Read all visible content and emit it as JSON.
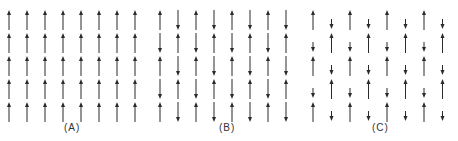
{
  "figure": {
    "color": "#2a2a2a",
    "panels": [
      {
        "id": "A",
        "label": "(A)",
        "name": "ferromagnetic",
        "columns": 8,
        "rows": 5,
        "spins": [
          [
            "up",
            "up",
            "up",
            "up",
            "up",
            "up",
            "up",
            "up"
          ],
          [
            "up",
            "up",
            "up",
            "up",
            "up",
            "up",
            "up",
            "up"
          ],
          [
            "up",
            "up",
            "up",
            "up",
            "up",
            "up",
            "up",
            "up"
          ],
          [
            "up",
            "up",
            "up",
            "up",
            "up",
            "up",
            "up",
            "up"
          ],
          [
            "up",
            "up",
            "up",
            "up",
            "up",
            "up",
            "up",
            "up"
          ]
        ],
        "magnitude_up": 1.0,
        "magnitude_down": 1.0
      },
      {
        "id": "B",
        "label": "(B)",
        "name": "antiferromagnetic",
        "columns": 8,
        "rows": 5,
        "spins": [
          [
            "up",
            "down",
            "up",
            "down",
            "up",
            "down",
            "up",
            "down"
          ],
          [
            "down",
            "up",
            "down",
            "up",
            "down",
            "up",
            "down",
            "up"
          ],
          [
            "up",
            "down",
            "up",
            "down",
            "up",
            "down",
            "up",
            "down"
          ],
          [
            "down",
            "up",
            "down",
            "up",
            "down",
            "up",
            "down",
            "up"
          ],
          [
            "up",
            "down",
            "up",
            "down",
            "up",
            "down",
            "up",
            "down"
          ]
        ],
        "magnitude_up": 1.0,
        "magnitude_down": 1.0
      },
      {
        "id": "C",
        "label": "(C)",
        "name": "ferrimagnetic",
        "columns": 8,
        "rows": 5,
        "spins": [
          [
            "up",
            "down",
            "up",
            "down",
            "up",
            "down",
            "up",
            "down"
          ],
          [
            "down",
            "up",
            "down",
            "up",
            "down",
            "up",
            "down",
            "up"
          ],
          [
            "up",
            "down",
            "up",
            "down",
            "up",
            "down",
            "up",
            "down"
          ],
          [
            "down",
            "up",
            "down",
            "up",
            "down",
            "up",
            "down",
            "up"
          ],
          [
            "up",
            "down",
            "up",
            "down",
            "up",
            "down",
            "up",
            "down"
          ]
        ],
        "magnitude_up": 1.0,
        "magnitude_down": 0.5
      }
    ]
  }
}
